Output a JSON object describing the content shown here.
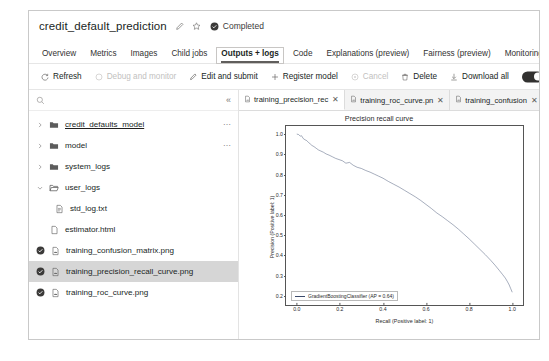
{
  "header": {
    "title": "credit_default_prediction",
    "edit_icon": "pencil-icon",
    "favorite_icon": "star-icon",
    "status_icon": "completed-check-icon",
    "status_label": "Completed",
    "status_color": "#3b3a39"
  },
  "tabs": [
    {
      "label": "Overview",
      "active": false
    },
    {
      "label": "Metrics",
      "active": false
    },
    {
      "label": "Images",
      "active": false
    },
    {
      "label": "Child jobs",
      "active": false
    },
    {
      "label": "Outputs + logs",
      "active": true
    },
    {
      "label": "Code",
      "active": false
    },
    {
      "label": "Explanations (preview)",
      "active": false
    },
    {
      "label": "Fairness (preview)",
      "active": false
    },
    {
      "label": "Monitoring",
      "active": false
    }
  ],
  "commandbar": {
    "items": [
      {
        "label": "Refresh",
        "icon": "refresh-icon",
        "disabled": false
      },
      {
        "label": "Debug and monitor",
        "icon": "debug-icon",
        "disabled": true
      },
      {
        "label": "Edit and submit",
        "icon": "pencil-icon",
        "disabled": false
      },
      {
        "label": "Register model",
        "icon": "plus-icon",
        "disabled": false
      },
      {
        "label": "Cancel",
        "icon": "cancel-icon",
        "disabled": true
      },
      {
        "label": "Delete",
        "icon": "trash-icon",
        "disabled": false
      },
      {
        "label": "Download all",
        "icon": "download-icon",
        "disabled": false
      }
    ],
    "toggle_state": "on"
  },
  "file_browser": {
    "search_placeholder": "",
    "search_value": "",
    "search_icon": "search-icon",
    "collapse_icon": "double-chevron-left-icon",
    "tree": [
      {
        "label": "credit_defaults_model",
        "type": "folder",
        "expandable": true,
        "expanded": false,
        "indent": 0,
        "link": true,
        "overflow": true,
        "selected": false,
        "status": false
      },
      {
        "label": "model",
        "type": "folder",
        "expandable": true,
        "expanded": false,
        "indent": 0,
        "link": false,
        "overflow": true,
        "selected": false,
        "status": false
      },
      {
        "label": "system_logs",
        "type": "folder",
        "expandable": true,
        "expanded": false,
        "indent": 0,
        "link": false,
        "overflow": false,
        "selected": false,
        "status": false
      },
      {
        "label": "user_logs",
        "type": "folder-open",
        "expandable": true,
        "expanded": true,
        "indent": 0,
        "link": false,
        "overflow": false,
        "selected": false,
        "status": false
      },
      {
        "label": "std_log.txt",
        "type": "file-text",
        "expandable": false,
        "expanded": false,
        "indent": 1,
        "link": false,
        "overflow": false,
        "selected": false,
        "status": false
      },
      {
        "label": "estimator.html",
        "type": "file-blank",
        "expandable": false,
        "expanded": false,
        "indent": 0,
        "link": false,
        "overflow": false,
        "selected": false,
        "status": false
      },
      {
        "label": "training_confusion_matrix.png",
        "type": "file-image",
        "expandable": false,
        "expanded": false,
        "indent": 0,
        "link": false,
        "overflow": false,
        "selected": false,
        "status": true
      },
      {
        "label": "training_precision_recall_curve.png",
        "type": "file-image",
        "expandable": false,
        "expanded": false,
        "indent": 0,
        "link": false,
        "overflow": false,
        "selected": true,
        "status": true
      },
      {
        "label": "training_roc_curve.png",
        "type": "file-image",
        "expandable": false,
        "expanded": false,
        "indent": 0,
        "link": false,
        "overflow": false,
        "selected": false,
        "status": true
      }
    ]
  },
  "viewer": {
    "file_tabs": [
      {
        "label": "training_precision_rec",
        "icon": "image-file-icon",
        "close_icon": "close-icon",
        "active": true
      },
      {
        "label": "training_roc_curve.pn",
        "icon": "image-file-icon",
        "close_icon": "close-icon",
        "active": false
      },
      {
        "label": "training_confusion",
        "icon": "image-file-icon",
        "close_icon": "close-icon",
        "active": false
      }
    ]
  },
  "chart_data": {
    "type": "line",
    "title": "Precision recall curve",
    "xlabel": "Recall (Positive label: 1)",
    "ylabel": "Precision (Positive label: 1)",
    "xlim": [
      -0.05,
      1.05
    ],
    "ylim": [
      0.155,
      1.04
    ],
    "xticks": [
      0.0,
      0.2,
      0.4,
      0.6,
      0.8,
      1.0
    ],
    "xtick_labels": [
      "0.0",
      "0.2",
      "0.4",
      "0.6",
      "0.8",
      "1.0"
    ],
    "yticks": [
      0.2,
      0.3,
      0.4,
      0.5,
      0.6,
      0.7,
      0.8,
      0.9,
      1.0
    ],
    "ytick_labels": [
      "0.2",
      "0.3",
      "0.4",
      "0.5",
      "0.6",
      "0.7",
      "0.8",
      "0.9",
      "1.0"
    ],
    "grid": false,
    "legend_position": "lower left",
    "line_color": "#3b4a6b",
    "series": [
      {
        "name": "GradientBoostingClassifier (AP = 0.64)",
        "x": [
          0.0,
          0.008,
          0.016,
          0.022,
          0.03,
          0.038,
          0.046,
          0.055,
          0.062,
          0.07,
          0.08,
          0.09,
          0.1,
          0.112,
          0.124,
          0.136,
          0.15,
          0.165,
          0.18,
          0.196,
          0.212,
          0.228,
          0.245,
          0.262,
          0.28,
          0.3,
          0.32,
          0.34,
          0.36,
          0.38,
          0.4,
          0.425,
          0.45,
          0.475,
          0.5,
          0.525,
          0.55,
          0.575,
          0.6,
          0.625,
          0.65,
          0.675,
          0.7,
          0.725,
          0.75,
          0.775,
          0.8,
          0.825,
          0.85,
          0.875,
          0.9,
          0.92,
          0.94,
          0.955,
          0.968,
          0.978,
          0.986,
          0.993,
          1.0
        ],
        "y": [
          1.0,
          0.998,
          0.99,
          0.992,
          0.978,
          0.972,
          0.968,
          0.958,
          0.952,
          0.944,
          0.938,
          0.93,
          0.922,
          0.916,
          0.91,
          0.902,
          0.896,
          0.888,
          0.88,
          0.874,
          0.868,
          0.856,
          0.86,
          0.846,
          0.836,
          0.83,
          0.82,
          0.812,
          0.802,
          0.792,
          0.782,
          0.766,
          0.752,
          0.738,
          0.722,
          0.706,
          0.69,
          0.672,
          0.652,
          0.632,
          0.61,
          0.592,
          0.572,
          0.552,
          0.53,
          0.506,
          0.482,
          0.456,
          0.43,
          0.404,
          0.376,
          0.352,
          0.326,
          0.306,
          0.288,
          0.27,
          0.254,
          0.236,
          0.218
        ],
        "average_precision": 0.64
      }
    ]
  }
}
